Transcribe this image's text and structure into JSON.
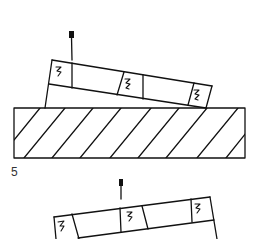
{
  "diagram": {
    "type": "technical-line-drawing",
    "colors": {
      "stroke": "#111111",
      "background": "#ffffff",
      "label": "#333333"
    },
    "figure_label": "5",
    "top_figure": {
      "description": "Tilted segmented bar with three spring elements resting on a hatched base, with a vertical pin marker above",
      "pin": {
        "x1": 71,
        "y1": 36,
        "x2": 72,
        "y2": 60,
        "head": {
          "x": 69,
          "y": 31,
          "w": 5,
          "h": 6
        }
      },
      "bar_top_edge": [
        [
          52,
          60
        ],
        [
          212,
          86
        ]
      ],
      "bar_mid_edge": [
        [
          49,
          84
        ],
        [
          206,
          108
        ]
      ],
      "bar_right_edge": [
        [
          212,
          86
        ],
        [
          206,
          108
        ]
      ],
      "bar_left_edge": [
        [
          52,
          60
        ],
        [
          45,
          108
        ]
      ],
      "segment_dividers": [
        [
          [
            72,
            64
          ],
          [
            72,
            88
          ]
        ],
        [
          [
            124,
            72
          ],
          [
            117,
            95
          ]
        ],
        [
          [
            143,
            75
          ],
          [
            143,
            99
          ]
        ],
        [
          [
            193,
            83
          ],
          [
            187,
            105
          ]
        ]
      ],
      "springs": [
        {
          "x": 58,
          "y": 67
        },
        {
          "x": 127,
          "y": 79
        },
        {
          "x": 195,
          "y": 90
        }
      ],
      "base": {
        "x": 14,
        "y": 108,
        "w": 231,
        "h": 50,
        "hatch": "diagonal"
      }
    },
    "bottom_figure": {
      "description": "Tilted segmented bar with three spring elements and a vertical pin marker above (cropped at bottom)",
      "pin": {
        "x1": 121,
        "y1": 185,
        "x2": 121,
        "y2": 199,
        "head": {
          "x": 119,
          "y": 179,
          "w": 4,
          "h": 6
        }
      },
      "bar_top_edge": [
        [
          54,
          217
        ],
        [
          210,
          197
        ]
      ],
      "bar_mid_edge": [
        [
          78,
          238
        ],
        [
          214,
          220
        ]
      ],
      "bar_left_edge": [
        [
          54,
          217
        ],
        [
          56,
          239
        ]
      ],
      "bar_right_edge": [
        [
          210,
          197
        ],
        [
          217,
          239
        ]
      ],
      "segment_dividers": [
        [
          [
            72,
            214
          ],
          [
            79,
            239
          ]
        ],
        [
          [
            120,
            208
          ],
          [
            121,
            232
          ]
        ],
        [
          [
            142,
            206
          ],
          [
            148,
            229
          ]
        ],
        [
          [
            191,
            199
          ],
          [
            192,
            222
          ]
        ]
      ],
      "springs": [
        {
          "x": 60,
          "y": 224
        },
        {
          "x": 129,
          "y": 213
        },
        {
          "x": 196,
          "y": 205
        }
      ]
    }
  }
}
